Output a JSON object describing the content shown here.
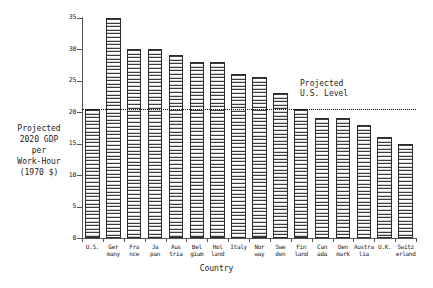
{
  "chart_data": {
    "type": "bar",
    "title": "",
    "xlabel": "Country",
    "ylabel": "Projected\n2020 GDP\nper\nWork-Hour\n(1970 $)",
    "ylim": [
      0,
      35
    ],
    "yticks": [
      0,
      5,
      10,
      15,
      20,
      25,
      30,
      35
    ],
    "ytick_labels": [
      "0",
      "5",
      "10",
      "15",
      "20",
      "25",
      "30",
      "35"
    ],
    "grid": false,
    "legend": "none",
    "categories": [
      "U.S.",
      "Ger\nmany",
      "Fra\nnce",
      "Ja\npan",
      "Aus\ntria",
      "Bel\ngium",
      "Hol\nland",
      "Italy",
      "Nor\nway",
      "Swe\nden",
      "Fin\nland",
      "Can\nada",
      "Den\nmark",
      "Austra\nlia",
      "U.K.",
      "Switz\nerland"
    ],
    "values": [
      20.5,
      35.0,
      30.0,
      30.0,
      29.0,
      28.0,
      28.0,
      26.0,
      25.5,
      23.0,
      20.5,
      19.0,
      19.0,
      18.0,
      16.0,
      15.0
    ],
    "annotations": [
      {
        "name": "projected-us-level",
        "text": "Projected\nU.S. Level",
        "reference_value": 20.5,
        "line_style": "dotted"
      }
    ]
  },
  "colors": {
    "bar_outline": "#2b2b2b",
    "bar_hatch": "#3c3c3c",
    "axis": "#555555",
    "text": "#222222",
    "reference_line": "#111111",
    "background": "#ffffff"
  }
}
